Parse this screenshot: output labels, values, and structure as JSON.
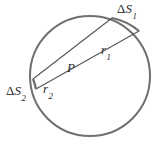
{
  "figure": {
    "background_color": "#ffffff",
    "stroke_color": "#6f6f6f",
    "line_color": "#555555",
    "text_color": "#2b2b2b"
  },
  "geometry": {
    "circle": {
      "center_x": 90,
      "center_y": 76,
      "radius": 60,
      "stroke_width": 2.0
    },
    "point_p": {
      "x": 71,
      "y": 70
    },
    "chord_1": {
      "from_x": 33,
      "from_y": 79,
      "to_x": 112,
      "to_y": 18
    },
    "chord_2": {
      "from_x": 36,
      "from_y": 89,
      "to_x": 139,
      "to_y": 31
    },
    "arc_delta_s1": {
      "start_x": 112,
      "start_y": 18,
      "end_x": 139,
      "end_y": 31
    },
    "arc_delta_s2": {
      "start_x": 33,
      "start_y": 79,
      "end_x": 36,
      "end_y": 89
    }
  },
  "labels": {
    "delta_s1": {
      "delta": "Δ",
      "symbol": "S",
      "subscript": "1"
    },
    "delta_s2": {
      "delta": "Δ",
      "symbol": "S",
      "subscript": "2"
    },
    "r1": {
      "symbol": "r",
      "subscript": "1"
    },
    "r2": {
      "symbol": "r",
      "subscript": "2"
    },
    "point_p": {
      "symbol": "P"
    }
  }
}
